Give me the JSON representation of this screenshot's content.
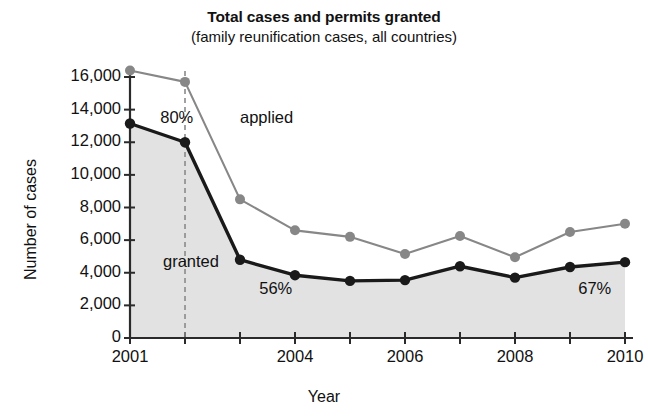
{
  "chart_data": {
    "type": "line",
    "title": "Total cases and permits granted",
    "subtitle": "(family reunification cases, all countries)",
    "xlabel": "Year",
    "ylabel": "Number of cases",
    "x": [
      2001,
      2002,
      2003,
      2004,
      2005,
      2006,
      2007,
      2008,
      2009,
      2010
    ],
    "xtick_labels": [
      "2001",
      "2004",
      "2006",
      "2008",
      "2010"
    ],
    "xtick_values": [
      2001,
      2004,
      2006,
      2008,
      2010
    ],
    "xlim": [
      2001,
      2010
    ],
    "ylim": [
      0,
      16000
    ],
    "ytick_labels": [
      "0",
      "2,000",
      "4,000",
      "6,000",
      "8,000",
      "10,000",
      "12,000",
      "14,000",
      "16,000"
    ],
    "ytick_values": [
      0,
      2000,
      4000,
      6000,
      8000,
      10000,
      12000,
      14000,
      16000
    ],
    "grid": false,
    "legend_position": "inline-labels",
    "series": [
      {
        "name": "applied",
        "color": "#878787",
        "marker": "circle",
        "values": [
          16400,
          15700,
          8500,
          6600,
          6200,
          5150,
          6250,
          4950,
          6500,
          7000
        ]
      },
      {
        "name": "granted",
        "color": "#1a1a1a",
        "marker": "circle",
        "fill": "#e2e2e2",
        "values": [
          13150,
          12000,
          4800,
          3850,
          3500,
          3550,
          4400,
          3700,
          4350,
          4650
        ]
      }
    ],
    "annotations": [
      {
        "text": "80%",
        "x": 2001.55,
        "y": 13450
      },
      {
        "text": "56%",
        "x": 2003.35,
        "y": 2950
      },
      {
        "text": "67%",
        "x": 2009.15,
        "y": 2950
      },
      {
        "text": "applied",
        "x": 2003.0,
        "y": 13400
      },
      {
        "text": "granted",
        "x": 2001.6,
        "y": 4600
      }
    ],
    "reference_line": {
      "x": 2002,
      "style": "dashed",
      "color": "#8a8a8a"
    }
  }
}
